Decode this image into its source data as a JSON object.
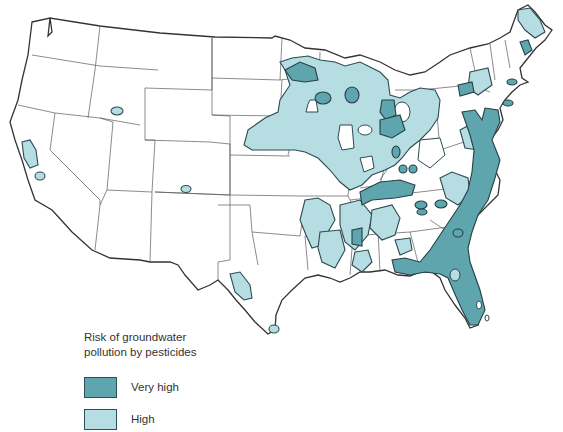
{
  "map": {
    "title": "Risk of groundwater pollution by pesticides",
    "region": "Contiguous United States",
    "colors": {
      "very_high": "#5ea5ad",
      "high": "#b5dde2",
      "outline": "#2d4a52",
      "land": "#ffffff",
      "state_border": "#5a5a5a"
    }
  },
  "legend": {
    "title_line1": "Risk of groundwater",
    "title_line2": "pollution by pesticides",
    "items": [
      {
        "label": "Very high",
        "color": "#5ea5ad"
      },
      {
        "label": "High",
        "color": "#b5dde2"
      }
    ]
  }
}
